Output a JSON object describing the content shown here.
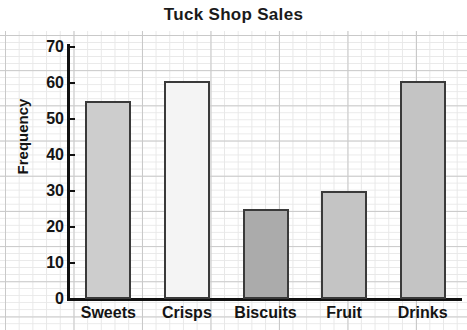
{
  "chart_data": {
    "type": "bar",
    "title": "Tuck Shop Sales",
    "xlabel": "",
    "ylabel": "Frequency",
    "categories": [
      "Sweets",
      "Crisps",
      "Biscuits",
      "Fruit",
      "Drinks"
    ],
    "values": [
      55,
      60.5,
      25,
      30,
      60.5
    ],
    "bar_colors": [
      "#cdcdcd",
      "#f4f4f4",
      "#ababab",
      "#c4c4c4",
      "#c4c4c4"
    ],
    "bar_border_color": "#3a3a3a",
    "ylim": [
      0,
      70
    ],
    "ytick_labels": [
      "0",
      "10",
      "20",
      "30",
      "40",
      "50",
      "60",
      "70"
    ],
    "ytick_values": [
      0,
      10,
      20,
      30,
      40,
      50,
      60,
      70
    ],
    "grid": true,
    "grid_style": "graph-paper",
    "grid_major_color": "#c9c9c9",
    "grid_minor_color": "#e8e8e8",
    "axis_color": "#111111",
    "legend": null,
    "background": "#ffffff"
  }
}
